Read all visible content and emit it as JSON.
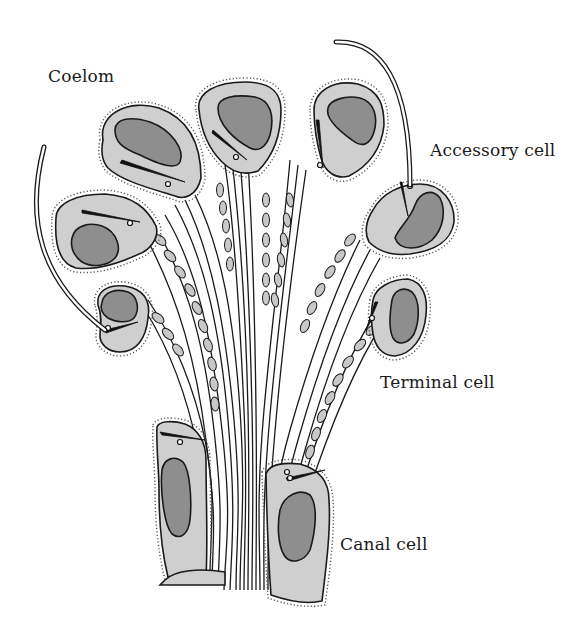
{
  "diagram": {
    "labels": {
      "coelom": "Coelom",
      "accessory_cell": "Accessory cell",
      "terminal_cell": "Terminal cell",
      "canal_cell": "Canal cell"
    },
    "colors": {
      "background": "#ffffff",
      "cytoplasm": "#cfcfcf",
      "nucleus": "#8e8e8e",
      "outline": "#1a1a1a"
    }
  }
}
